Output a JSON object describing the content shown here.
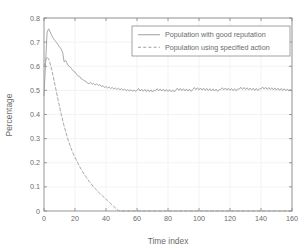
{
  "chart_data": {
    "type": "line",
    "title": "",
    "xlabel": "Time index",
    "ylabel": "Percentage",
    "xlim": [
      0,
      160
    ],
    "ylim": [
      0,
      0.8
    ],
    "xticks": [
      0,
      20,
      40,
      60,
      80,
      100,
      120,
      140,
      160
    ],
    "xtick_labels": [
      "0",
      "20",
      "40",
      "60",
      "80",
      "100",
      "120",
      "140",
      "160"
    ],
    "yticks": [
      0,
      0.1,
      0.2,
      0.3,
      0.4,
      0.5,
      0.6,
      0.7,
      0.8
    ],
    "ytick_labels": [
      "0",
      "0.1",
      "0.2",
      "0.3",
      "0.4",
      "0.5",
      "0.6",
      "0.7",
      "0.8"
    ],
    "grid": true,
    "legend_position": "upper right",
    "line_color": "#9a9a9a",
    "axis_color": "#8c8c8c",
    "text_color": "#6b6b6b",
    "series": [
      {
        "name": "Population with good reputation",
        "style": "solid",
        "color": "#9a9a9a",
        "x": [
          0,
          1,
          2,
          3,
          4,
          5,
          6,
          7,
          8,
          9,
          10,
          11,
          12,
          13,
          14,
          15,
          16,
          17,
          18,
          19,
          20,
          21,
          22,
          23,
          24,
          25,
          26,
          27,
          28,
          29,
          30,
          31,
          32,
          33,
          34,
          35,
          36,
          37,
          38,
          39,
          40,
          41,
          42,
          43,
          44,
          45,
          46,
          47,
          48,
          49,
          50,
          51,
          52,
          53,
          54,
          55,
          56,
          57,
          58,
          59,
          60,
          61,
          62,
          63,
          64,
          65,
          66,
          67,
          68,
          69,
          70,
          71,
          72,
          73,
          74,
          75,
          76,
          77,
          78,
          79,
          80,
          81,
          82,
          83,
          84,
          85,
          86,
          87,
          88,
          89,
          90,
          91,
          92,
          93,
          94,
          95,
          96,
          97,
          98,
          99,
          100,
          101,
          102,
          103,
          104,
          105,
          106,
          107,
          108,
          109,
          110,
          111,
          112,
          113,
          114,
          115,
          116,
          117,
          118,
          119,
          120,
          121,
          122,
          123,
          124,
          125,
          126,
          127,
          128,
          129,
          130,
          131,
          132,
          133,
          134,
          135,
          136,
          137,
          138,
          139,
          140,
          141,
          142,
          143,
          144,
          145,
          146,
          147,
          148,
          149,
          150,
          151,
          152,
          153,
          154,
          155,
          156,
          157,
          158,
          159,
          160
        ],
        "y": [
          0.478,
          0.61,
          0.742,
          0.755,
          0.742,
          0.727,
          0.716,
          0.706,
          0.7,
          0.69,
          0.68,
          0.672,
          0.658,
          0.618,
          0.624,
          0.61,
          0.6,
          0.596,
          0.588,
          0.58,
          0.576,
          0.566,
          0.56,
          0.558,
          0.548,
          0.545,
          0.54,
          0.538,
          0.53,
          0.528,
          0.533,
          0.525,
          0.529,
          0.522,
          0.527,
          0.52,
          0.524,
          0.516,
          0.52,
          0.512,
          0.516,
          0.51,
          0.514,
          0.508,
          0.512,
          0.506,
          0.51,
          0.504,
          0.509,
          0.503,
          0.507,
          0.501,
          0.505,
          0.499,
          0.503,
          0.498,
          0.502,
          0.497,
          0.501,
          0.496,
          0.5,
          0.508,
          0.497,
          0.505,
          0.496,
          0.504,
          0.495,
          0.503,
          0.494,
          0.502,
          0.493,
          0.501,
          0.499,
          0.507,
          0.498,
          0.506,
          0.497,
          0.505,
          0.496,
          0.504,
          0.495,
          0.503,
          0.494,
          0.502,
          0.493,
          0.501,
          0.509,
          0.5,
          0.508,
          0.499,
          0.507,
          0.498,
          0.506,
          0.497,
          0.505,
          0.496,
          0.504,
          0.512,
          0.503,
          0.511,
          0.502,
          0.51,
          0.501,
          0.509,
          0.5,
          0.508,
          0.499,
          0.507,
          0.498,
          0.506,
          0.497,
          0.505,
          0.496,
          0.504,
          0.503,
          0.511,
          0.502,
          0.51,
          0.501,
          0.509,
          0.5,
          0.508,
          0.499,
          0.507,
          0.498,
          0.506,
          0.505,
          0.513,
          0.504,
          0.512,
          0.503,
          0.511,
          0.502,
          0.51,
          0.501,
          0.509,
          0.5,
          0.508,
          0.499,
          0.507,
          0.506,
          0.514,
          0.505,
          0.513,
          0.504,
          0.512,
          0.503,
          0.511,
          0.502,
          0.51,
          0.501,
          0.509,
          0.5,
          0.508,
          0.499,
          0.507,
          0.498,
          0.506,
          0.497,
          0.505,
          0.496
        ]
      },
      {
        "name": "Population using specified action",
        "style": "dashed",
        "color": "#9a9a9a",
        "x": [
          0,
          1,
          2,
          3,
          4,
          5,
          6,
          7,
          8,
          9,
          10,
          11,
          12,
          13,
          14,
          15,
          16,
          17,
          18,
          19,
          20,
          21,
          22,
          23,
          24,
          25,
          26,
          27,
          28,
          29,
          30,
          31,
          32,
          33,
          34,
          35,
          36,
          37,
          38,
          39,
          40,
          41,
          42,
          43,
          44,
          45,
          46,
          47,
          48,
          49,
          50,
          55,
          60,
          65,
          70,
          75,
          80,
          85,
          90,
          95,
          100,
          105,
          110,
          115,
          120,
          125,
          130,
          135,
          140,
          145,
          150,
          155,
          160
        ],
        "y": [
          0.6,
          0.625,
          0.638,
          0.63,
          0.61,
          0.585,
          0.556,
          0.525,
          0.494,
          0.463,
          0.433,
          0.404,
          0.377,
          0.352,
          0.328,
          0.306,
          0.286,
          0.268,
          0.251,
          0.236,
          0.222,
          0.209,
          0.196,
          0.184,
          0.173,
          0.162,
          0.152,
          0.142,
          0.133,
          0.124,
          0.116,
          0.108,
          0.1,
          0.093,
          0.086,
          0.079,
          0.073,
          0.067,
          0.061,
          0.055,
          0.049,
          0.043,
          0.037,
          0.031,
          0.025,
          0.019,
          0.013,
          0.007,
          0.002,
          0.001,
          0.0,
          0.0,
          0.0,
          0.0,
          0.0,
          0.0,
          0.0,
          0.0,
          0.0,
          0.0,
          0.0,
          0.0,
          0.0,
          0.0,
          0.0,
          0.0,
          0.0,
          0.0,
          0.0,
          0.0,
          0.0,
          0.0,
          0.0
        ]
      }
    ]
  }
}
